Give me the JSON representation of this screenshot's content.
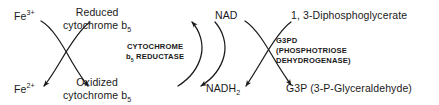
{
  "diagram": {
    "stroke_color": "#1a1a1a",
    "background_color": "#ffffff",
    "text_color": "#1a1a1a"
  },
  "species": {
    "fe3": "Fe",
    "fe3_charge": "3+",
    "fe2": "Fe",
    "fe2_charge": "2+",
    "reduced_cyt_line1": "Reduced",
    "reduced_cyt_line2": "cytochrome b",
    "reduced_cyt_sub": "5",
    "oxidized_cyt_line1": "Oxidized",
    "oxidized_cyt_line2": "cytochrome b",
    "oxidized_cyt_sub": "5",
    "nad": "NAD",
    "nadh2": "NADH",
    "nadh2_sub": "2",
    "diphosphoglycerate": "1, 3-Diphosphoglycerate",
    "g3p": "G3P (3-P-Glyceraldehyde)"
  },
  "enzymes": {
    "cytb5_reductase_line1": "CYTOCHROME",
    "cytb5_reductase_line2_prefix": "b",
    "cytb5_reductase_line2_sub": "5",
    "cytb5_reductase_line2_suffix": " REDUCTASE",
    "g3pd_line1": "G3PD",
    "g3pd_line2": "(PHOSPHOTRIOSE",
    "g3pd_line3": "DEHYDROGENASE)"
  }
}
